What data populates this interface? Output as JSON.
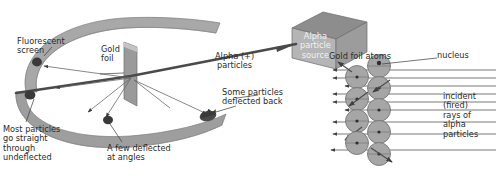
{
  "diagram": {
    "colors": {
      "screen_band": "#a8a8a8",
      "screen_band_dark": "#8f8f8f",
      "foil": "#9a9a9a",
      "foil_light": "#c9c9c9",
      "source_box": "#b5b5b5",
      "source_box_top": "#8d8d8d",
      "source_box_side": "#a0a0a0",
      "atom_fill": "#a6a6a6",
      "atom_stroke": "#6f6f6f",
      "nucleus": "#2e2e2e",
      "ray": "#555555",
      "beam": "#4a4a4a",
      "text": "#2b2b2b",
      "leader": "#3a3a3a",
      "spot": "#3a3a3a"
    },
    "labels": {
      "fluorescent_screen": "Fluorescent\nscreen",
      "gold_foil": "Gold\nfoil",
      "alpha_particles": "Alpha (+)\nparticles",
      "alpha_source": "Alpha\nparticle\nsource",
      "most_particles": "Most particles\ngo straight\nthrough\nundeflected",
      "few_deflected": "A few deflected\nat angles",
      "some_deflected_back": "Some particles\ndeflected back",
      "gold_foil_atoms": "Gold foil atoms",
      "nucleus": "nucleus",
      "incident_rays": "incident\n(fired)\nrays of\nalpha\nparticles"
    },
    "atoms": {
      "radius": 11.5,
      "left_column_x": 357,
      "right_column_x": 379,
      "left_column_y": [
        77,
        99,
        121,
        143
      ],
      "right_column_y": [
        66,
        88,
        110,
        132,
        154
      ],
      "count_left": 4,
      "count_right": 5
    },
    "incident_rays": {
      "count": 9,
      "y_values": [
        70,
        78,
        86,
        94,
        102,
        110,
        122,
        134,
        150
      ],
      "x_start": 496,
      "x_end": 331
    },
    "scintillation_spots": [
      {
        "x": 37,
        "y": 62
      },
      {
        "x": 30,
        "y": 95
      },
      {
        "x": 108,
        "y": 120
      },
      {
        "x": 208,
        "y": 116
      }
    ]
  }
}
